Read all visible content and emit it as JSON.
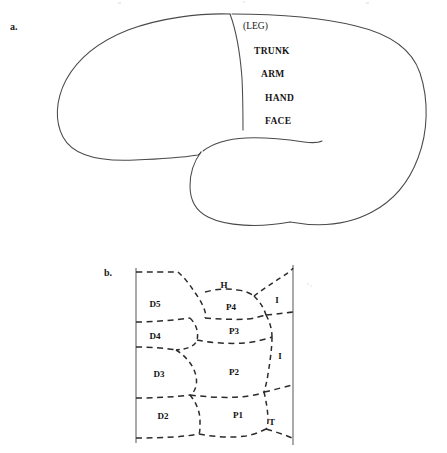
{
  "figure": {
    "background_color": "#ffffff",
    "line_color": "#4a4a4a",
    "dash_color": "#2b2b2b",
    "border_color": "#777777",
    "text_color": "#161616"
  },
  "panel_a": {
    "letter": "a.",
    "labels": [
      {
        "id": "leg",
        "text": "(LEG)",
        "style": "paren"
      },
      {
        "id": "trunk",
        "text": "TRUNK",
        "style": "caps"
      },
      {
        "id": "arm",
        "text": "ARM",
        "style": "caps"
      },
      {
        "id": "hand",
        "text": "HAND",
        "style": "caps"
      },
      {
        "id": "face",
        "text": "FACE",
        "style": "caps"
      }
    ]
  },
  "panel_b": {
    "letter": "b.",
    "regions": [
      {
        "id": "d5",
        "text": "D5"
      },
      {
        "id": "d4",
        "text": "D4"
      },
      {
        "id": "d3",
        "text": "D3"
      },
      {
        "id": "d2",
        "text": "D2"
      },
      {
        "id": "p4",
        "text": "P4"
      },
      {
        "id": "p3",
        "text": "P3"
      },
      {
        "id": "p2",
        "text": "P2"
      },
      {
        "id": "p1",
        "text": "P1"
      },
      {
        "id": "h",
        "text": "H"
      },
      {
        "id": "i-upper",
        "text": "I"
      },
      {
        "id": "i-lower",
        "text": "I"
      },
      {
        "id": "t",
        "text": "T"
      }
    ]
  }
}
